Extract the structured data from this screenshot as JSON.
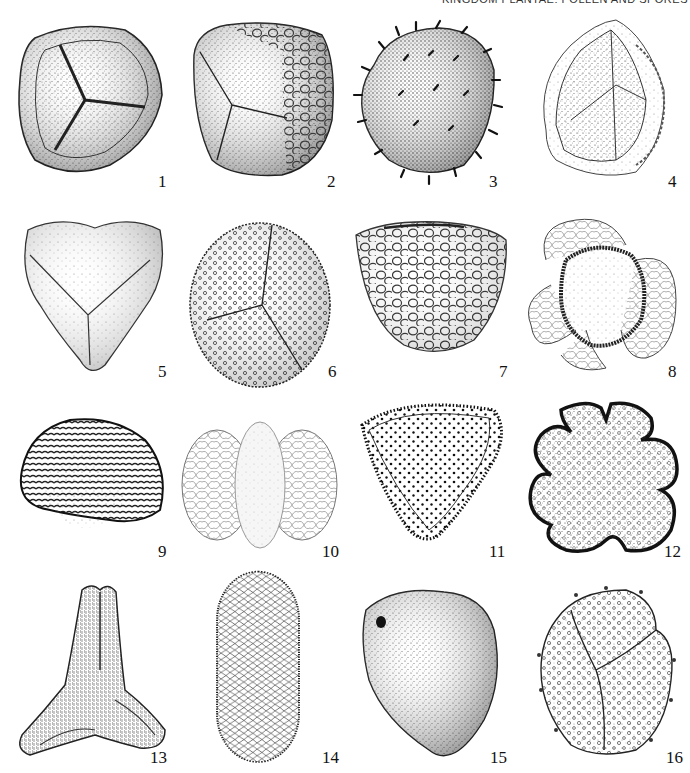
{
  "header": {
    "title": "KINGDOM PLANTAE: POLLEN AND SPORES"
  },
  "plate": {
    "figures": [
      {
        "number": "1",
        "subject": "trilete spore with thick rim"
      },
      {
        "number": "2",
        "subject": "trilete spore with reticulate perine"
      },
      {
        "number": "3",
        "subject": "spiny spore"
      },
      {
        "number": "4",
        "subject": "trilete spore with loose perine"
      },
      {
        "number": "5",
        "subject": "triangular trilete spore"
      },
      {
        "number": "6",
        "subject": "echinate trilete spore"
      },
      {
        "number": "7",
        "subject": "verrucate monolete spore"
      },
      {
        "number": "8",
        "subject": "trisaccate pollen"
      },
      {
        "number": "9",
        "subject": "striate pollen"
      },
      {
        "number": "10",
        "subject": "bisaccate pollen"
      },
      {
        "number": "11",
        "subject": "triangular punctate pollen"
      },
      {
        "number": "12",
        "subject": "lobed stephanocolpate pollen"
      },
      {
        "number": "13",
        "subject": "three-armed pollen"
      },
      {
        "number": "14",
        "subject": "reticulate elongate pollen"
      },
      {
        "number": "15",
        "subject": "smooth porate pollen"
      },
      {
        "number": "16",
        "subject": "trilete spore with small spines"
      }
    ]
  }
}
